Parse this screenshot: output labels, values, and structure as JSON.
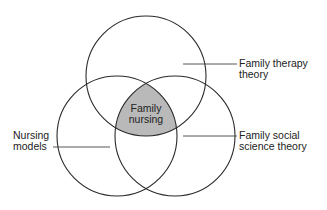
{
  "diagram": {
    "type": "venn",
    "circles": [
      {
        "id": "family-therapy-theory",
        "label_lines": [
          "Family therapy",
          "theory"
        ],
        "cx": 146,
        "cy": 76,
        "r": 60
      },
      {
        "id": "nursing-models",
        "label_lines": [
          "Nursing",
          "models"
        ],
        "cx": 117,
        "cy": 136,
        "r": 60
      },
      {
        "id": "family-social-science-theory",
        "label_lines": [
          "Family social",
          "science theory"
        ],
        "cx": 175,
        "cy": 136,
        "r": 60
      }
    ],
    "intersection": {
      "label_lines": [
        "Family",
        "nursing"
      ],
      "fill": "#b9b9b9"
    },
    "stroke_color": "#2a2a2a",
    "leader_color": "#444444"
  }
}
